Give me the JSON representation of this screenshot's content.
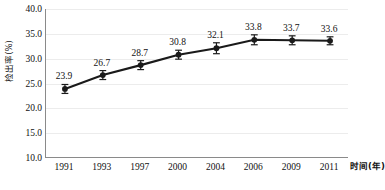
{
  "chart_data": {
    "type": "line",
    "title": "",
    "xlabel": "时间(年)",
    "ylabel": "检出率(%)",
    "categories": [
      "1991",
      "1993",
      "1997",
      "2000",
      "2004",
      "2006",
      "2009",
      "2011"
    ],
    "values": [
      23.9,
      26.7,
      28.7,
      30.8,
      32.1,
      33.8,
      33.7,
      33.6
    ],
    "errors": [
      0.9,
      0.9,
      0.9,
      0.9,
      1.1,
      1.0,
      0.9,
      0.8
    ],
    "point_labels": [
      "23.9",
      "26.7",
      "28.7",
      "30.8",
      "32.1",
      "33.8",
      "33.7",
      "33.6"
    ],
    "ylim": [
      10.0,
      40.0
    ],
    "ytick_step": 5.0,
    "ytick_labels": [
      "40.0",
      "35.0",
      "30.0",
      "25.0",
      "20.0",
      "15.0",
      "10.0"
    ],
    "ytick_values": [
      40.0,
      35.0,
      30.0,
      25.0,
      20.0,
      15.0,
      10.0
    ],
    "grid": true,
    "legend": "none",
    "series": [
      {
        "name": "检出率(%)",
        "values": [
          23.9,
          26.7,
          28.7,
          30.8,
          32.1,
          33.8,
          33.7,
          33.6
        ],
        "color": "#1a1a1a",
        "marker": "circle",
        "error_bars": true
      }
    ],
    "colors": {
      "line": "#1a1a1a",
      "marker": "#1a1a1a",
      "axis": "#8a8a8a",
      "grid": "#ececec",
      "text": "#111111",
      "background": "#ffffff"
    }
  }
}
